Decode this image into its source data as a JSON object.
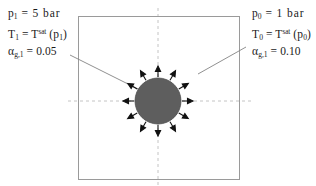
{
  "figure": {
    "background_color": "#ffffff",
    "domain_box": {
      "stroke_color": "#9a9a9a",
      "x": 78,
      "y": 16,
      "width": 162,
      "height": 164
    },
    "axes": {
      "style": "dashed",
      "color": "#c4c4c4",
      "vertical_x": 158,
      "horizontal_y": 101
    },
    "bubble": {
      "label": "vapor-bubble",
      "center_x": 158,
      "center_y": 101,
      "radius": 23,
      "fill_color": "#5e5e5e",
      "stroke_color": "#4a4a4a",
      "arrow_count": 12,
      "arrow_color": "#111111",
      "arrow_direction": "radially-outward"
    },
    "leader_lines": [
      {
        "name": "left-leader",
        "x1": 70,
        "y1": 55,
        "x2": 142,
        "y2": 91,
        "color": "#777777"
      },
      {
        "name": "right-leader",
        "x1": 246,
        "y1": 47,
        "x2": 198,
        "y2": 74,
        "color": "#777777"
      }
    ]
  },
  "labels": {
    "left": {
      "name": "inner-bubble-conditions",
      "lines": [
        {
          "pre": "p",
          "sub": "1",
          "mid": " = 5 bar",
          "sup": "",
          "post": ""
        },
        {
          "pre": "T",
          "sub": "1",
          "mid": " = T",
          "sup": "sat",
          "post": " (p",
          "post_sub": "1",
          "post_end": ")"
        },
        {
          "pre": "α",
          "sub": "g,1",
          "mid": " = 0.05",
          "sup": "",
          "post": ""
        }
      ],
      "line1_text": "p₁ = 5 bar",
      "line2_text": "T₁ = Tˢᵃᵗ (p₁)",
      "line3_text": "αg,1 = 0.05",
      "pressure_value": "5 bar",
      "void_fraction": "0.05"
    },
    "right": {
      "name": "ambient-liquid-conditions",
      "lines": [
        {
          "pre": "p",
          "sub": "0",
          "mid": " = 1 bar",
          "sup": "",
          "post": ""
        },
        {
          "pre": "T",
          "sub": "0",
          "mid": " = T",
          "sup": "sat",
          "post": " (p",
          "post_sub": "0",
          "post_end": ")"
        },
        {
          "pre": "α",
          "sub": "g,1",
          "mid": " = 0.10",
          "sup": "",
          "post": ""
        }
      ],
      "line1_text": "p₀ = 1 bar",
      "line2_text": "T₀ = Tˢᵃᵗ (p₀)",
      "line3_text": "αg,1 = 0.10",
      "pressure_value": "1 bar",
      "void_fraction": "0.10"
    }
  },
  "text_tokens": {
    "p": "p",
    "T": "T",
    "alpha": "α",
    "sat": "sat",
    "sub_1": "1",
    "sub_0": "0",
    "sub_g1": "g,1",
    "eq_5bar": " = 5 bar",
    "eq_1bar": " = 1 bar",
    "eq_T": " = T",
    "open_p": " (p",
    "close": ")",
    "eq_005": " = 0.05",
    "eq_010": " = 0.10"
  }
}
